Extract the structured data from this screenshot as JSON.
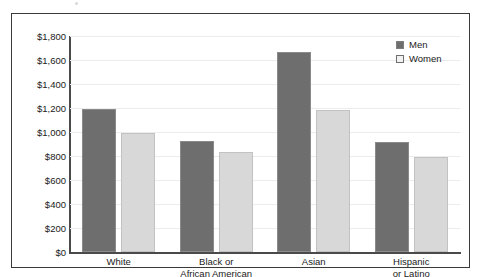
{
  "chart_data": {
    "type": "bar",
    "title": "",
    "subtitle": "",
    "xlabel": "",
    "ylabel": "",
    "categories": [
      "White",
      "Black or African American",
      "Asian",
      "Hispanic or Latino"
    ],
    "category_lines": [
      [
        "White"
      ],
      [
        "Black or",
        "African American"
      ],
      [
        "Asian"
      ],
      [
        "Hispanic",
        "or Latino"
      ]
    ],
    "series": [
      {
        "name": "Men",
        "values": [
          1190,
          925,
          1665,
          915
        ],
        "color": "#6e6e6e"
      },
      {
        "name": "Women",
        "values": [
          990,
          835,
          1185,
          790
        ],
        "color": "#d8d8d8"
      }
    ],
    "ylim": [
      0,
      1800
    ],
    "ytick_values": [
      1800,
      1600,
      1400,
      1200,
      1000,
      800,
      600,
      400,
      200,
      0
    ],
    "ytick_labels": [
      "$1,800",
      "$1,600",
      "$1,400",
      "$1,200",
      "$1,000",
      "$800",
      "$600",
      "$400",
      "$200",
      "$0"
    ],
    "grid": true,
    "legend_position": "top-right",
    "legend_entries": [
      "Men",
      "Women"
    ]
  },
  "colors": {
    "men_bar": "#6e6e6e",
    "women_bar": "#d8d8d8",
    "frame": "#3a3a3a",
    "axis": "#4a4a4a",
    "gridline": "#ececec",
    "text": "#1a1a1a",
    "background": "#ffffff"
  }
}
